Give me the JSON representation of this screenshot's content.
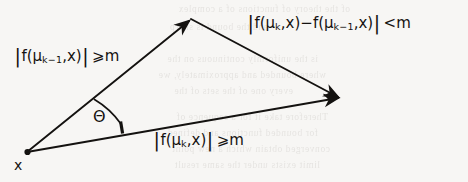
{
  "figure": {
    "kind": "vector-triangle-diagram",
    "background_color": "#f7f6f4",
    "ink_color": "#141210",
    "width": 468,
    "height": 182
  },
  "labels": {
    "left_side": {
      "full_text": "|f(μ_{k-1},x)| ≥ m",
      "open_bar": "|",
      "f": "f(",
      "mu": "μ",
      "sub": "k−1",
      "args": ",x)",
      "close_bar": "|",
      "relation": "⩾m"
    },
    "top_right": {
      "full_text": "|f(μ_k,x)−f(μ_{k-1},x)| < m",
      "open_bar": "|",
      "f1": "f(",
      "mu1": "μ",
      "sub1": "k",
      "args1": ",x)",
      "minus": "−",
      "f2": "f(",
      "mu2": "μ",
      "sub2": "k−1",
      "args2": ",x)",
      "close_bar": "|",
      "relation": "<m"
    },
    "bottom": {
      "full_text": "|f(μ_k,x)| ≥ m",
      "open_bar": "|",
      "f": "f(",
      "mu": "μ",
      "sub": "k",
      "args": ",x)",
      "close_bar": "|",
      "relation": "⩾m"
    },
    "angle": "Θ",
    "vertex_origin": "x"
  },
  "geometry": {
    "vertex_origin": [
      27,
      152
    ],
    "vertex_apex": [
      191,
      19
    ],
    "vertex_right": [
      340,
      98
    ],
    "arc_radius": 86,
    "tick_at": [
      121,
      124
    ]
  },
  "bleed_through_text": [
    {
      "text": "of the theory of functions of a complex",
      "left": 118,
      "top": 4
    },
    {
      "text": "and the bound is sharp",
      "left": 200,
      "top": 22
    },
    {
      "text": "is the uniformly continuous on the",
      "left": 150,
      "top": 54
    },
    {
      "text": "where  bounded and approximately, we",
      "left": 142,
      "top": 70
    },
    {
      "text": "every  one of the sets  of the",
      "left": 175,
      "top": 86
    },
    {
      "text": "Therefore  take  it  for  a  sequence of",
      "left": 140,
      "top": 112
    },
    {
      "text": "for  bounded functions and  defined",
      "left": 150,
      "top": 128
    },
    {
      "text": "converged  obtain  which  a  new point",
      "left": 138,
      "top": 144
    },
    {
      "text": "limit  exists  under  the  same  result",
      "left": 148,
      "top": 160
    }
  ]
}
